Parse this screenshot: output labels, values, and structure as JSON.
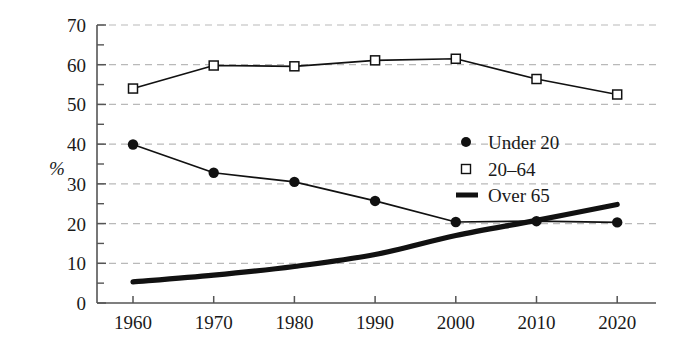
{
  "chart_data": {
    "type": "line",
    "title": "",
    "xlabel": "",
    "ylabel": "%",
    "x": [
      1960,
      1970,
      1980,
      1990,
      2000,
      2010,
      2020
    ],
    "xticklabels": [
      "1960",
      "1970",
      "1980",
      "1990",
      "2000",
      "2010",
      "2020"
    ],
    "yticklabels": [
      "0",
      "10",
      "20",
      "30",
      "40",
      "50",
      "60",
      "70"
    ],
    "ytickvalues": [
      0,
      10,
      20,
      30,
      40,
      50,
      60,
      70
    ],
    "yminorstep": 5,
    "xlim": [
      1955,
      2027
    ],
    "ylim": [
      0,
      70
    ],
    "grid": "horizontal-dashed",
    "legend_position": "center-right",
    "series": [
      {
        "name": "Under 20",
        "marker": "filled-circle",
        "values": [
          39.9,
          32.8,
          30.5,
          25.7,
          20.4,
          20.6,
          20.3
        ]
      },
      {
        "name": "20–64",
        "marker": "open-square",
        "values": [
          54.0,
          59.8,
          59.6,
          61.1,
          61.5,
          56.4,
          52.5
        ]
      },
      {
        "name": "Over 65",
        "marker": "none",
        "style": "thick-smooth-line",
        "values": [
          5.3,
          7.0,
          9.2,
          12.2,
          17.0,
          20.8,
          24.8
        ]
      }
    ]
  },
  "legend": {
    "items": [
      {
        "label": "Under 20",
        "marker": "filled-circle"
      },
      {
        "label": "20–64",
        "marker": "open-square"
      },
      {
        "label": "Over 65",
        "marker": "thick-line"
      }
    ]
  },
  "colors": {
    "ink": "#1a1a1a",
    "grid": "#b9b9b9",
    "axis": "#555555",
    "background": "#ffffff"
  }
}
